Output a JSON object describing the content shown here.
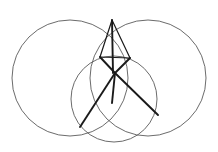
{
  "figure": {
    "background_color": "#ffffff",
    "width": 218,
    "height": 152,
    "circle_stroke_color": "#5a5a5a",
    "circle_stroke_width": 0.9,
    "segment_stroke_color": "#1a1a1a",
    "segment_stroke_width": 1.9,
    "thin_segment_stroke_width": 1.2
  },
  "circles": [
    {
      "name": "left-circle",
      "cx": 70,
      "cy": 78,
      "r": 58,
      "color": "#5a5a5a",
      "width": 0.9
    },
    {
      "name": "right-circle",
      "cx": 148,
      "cy": 78,
      "r": 58,
      "color": "#5a5a5a",
      "width": 0.9
    },
    {
      "name": "bottom-circle",
      "cx": 114,
      "cy": 99,
      "r": 43,
      "color": "#5a5a5a",
      "width": 0.9
    }
  ],
  "points": {
    "top_apex": {
      "name": "top-apex",
      "x": 112,
      "y": 20
    },
    "center_hub": {
      "name": "center-hub",
      "x": 115,
      "y": 73
    },
    "upper_left_node": {
      "name": "upper-left-node",
      "x": 100,
      "y": 57
    },
    "upper_right_node": {
      "name": "upper-right-node",
      "x": 130,
      "y": 58
    },
    "lower_left_vertex": {
      "name": "lower-left-vertex",
      "x": 80,
      "y": 127
    },
    "lower_right_vertex": {
      "name": "lower-right-vertex",
      "x": 158,
      "y": 115
    },
    "lower_mid_node": {
      "name": "lower-mid-node",
      "x": 112,
      "y": 103
    }
  },
  "segments": [
    {
      "name": "segment-apex-to-hub-left",
      "x1": 112,
      "y1": 20,
      "x2": 113,
      "y2": 73,
      "width": 1.9
    },
    {
      "name": "segment-apex-to-upper-left",
      "x1": 112,
      "y1": 20,
      "x2": 100,
      "y2": 57,
      "width": 1.2
    },
    {
      "name": "segment-apex-to-upper-right",
      "x1": 112,
      "y1": 20,
      "x2": 130,
      "y2": 58,
      "width": 1.2
    },
    {
      "name": "segment-upper-left-to-hub",
      "x1": 100,
      "y1": 57,
      "x2": 115,
      "y2": 73,
      "width": 1.9
    },
    {
      "name": "segment-upper-right-to-hub",
      "x1": 130,
      "y1": 58,
      "x2": 115,
      "y2": 73,
      "width": 1.9
    },
    {
      "name": "segment-hub-to-lower-left",
      "x1": 115,
      "y1": 73,
      "x2": 80,
      "y2": 127,
      "width": 1.9
    },
    {
      "name": "segment-hub-to-lower-right",
      "x1": 115,
      "y1": 73,
      "x2": 158,
      "y2": 115,
      "width": 1.9
    },
    {
      "name": "segment-hub-to-lower-mid",
      "x1": 115,
      "y1": 73,
      "x2": 112,
      "y2": 103,
      "width": 1.9
    },
    {
      "name": "segment-upper-left-to-upper-right",
      "x1": 100,
      "y1": 57,
      "x2": 130,
      "y2": 58,
      "width": 1.2
    }
  ]
}
